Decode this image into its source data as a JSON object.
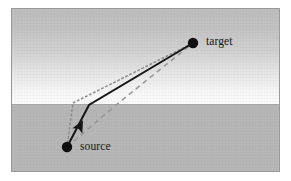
{
  "figure": {
    "type": "diagram",
    "width": 291,
    "height": 181
  },
  "panel": {
    "border_color": "#9a9a9a",
    "page_background": "#ffffff"
  },
  "media": {
    "upper": {
      "name": "upper-medium",
      "gradient_top_color": "#bdbdbd",
      "gradient_bottom_color": "#fbfbfb",
      "top": 0,
      "height": 95
    },
    "lower": {
      "name": "lower-medium",
      "color": "#b6b6b6",
      "top": 95
    },
    "interface": {
      "name": "medium-interface",
      "y": 95,
      "color": "#a8a8a8"
    }
  },
  "nodes": [
    {
      "id": "target",
      "label": "target",
      "x": 181,
      "y": 34,
      "radius": 5.2,
      "color": "#0d0d0d",
      "label_x": 194,
      "label_y": 33
    },
    {
      "id": "source",
      "label": "source",
      "x": 55,
      "y": 138,
      "radius": 5.2,
      "color": "#0d0d0d",
      "label_x": 68,
      "label_y": 138
    }
  ],
  "paths": [
    {
      "id": "refracted-path",
      "style": "solid",
      "color": "#141414",
      "width": 2.0,
      "dasharray": "",
      "has_arrowhead": true,
      "arrow_at": {
        "x": 68,
        "y": 117
      },
      "points": [
        {
          "x": 55,
          "y": 138
        },
        {
          "x": 77,
          "y": 96
        },
        {
          "x": 181,
          "y": 34
        }
      ]
    },
    {
      "id": "steep-dotted-path",
      "style": "dotted",
      "color": "#8f8f8f",
      "width": 1.6,
      "dasharray": "1.5 3",
      "has_arrowhead": false,
      "points": [
        {
          "x": 55,
          "y": 138
        },
        {
          "x": 61,
          "y": 94
        },
        {
          "x": 181,
          "y": 34
        }
      ]
    },
    {
      "id": "direct-dashed-path",
      "style": "dashed",
      "color": "#9a9a9a",
      "width": 1.6,
      "dasharray": "5 4",
      "has_arrowhead": false,
      "points": [
        {
          "x": 55,
          "y": 138
        },
        {
          "x": 104,
          "y": 96
        },
        {
          "x": 181,
          "y": 34
        }
      ]
    }
  ]
}
